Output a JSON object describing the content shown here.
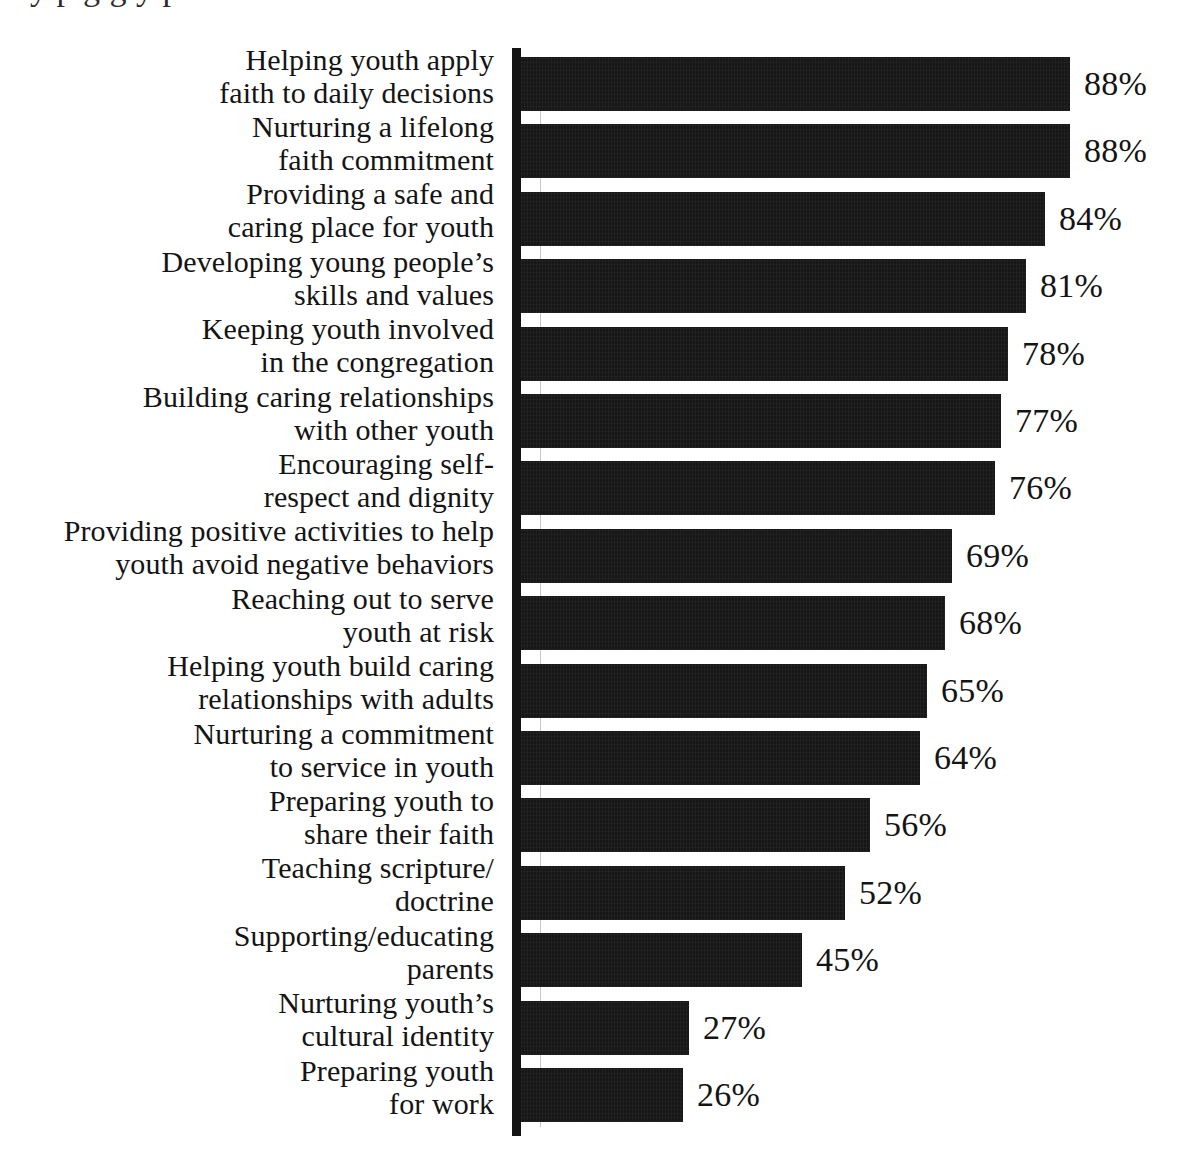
{
  "figure": {
    "top_cut_text": "y p              g g         y  p",
    "note": "scanned horizontal bar chart, no visible title or axis tick labels"
  },
  "chart_data": {
    "type": "bar",
    "orientation": "horizontal",
    "title": "",
    "subtitle": "",
    "xlabel": "",
    "ylabel": "",
    "xlim": [
      0,
      100
    ],
    "grid": true,
    "legend": false,
    "value_suffix": "%",
    "categories": [
      "Helping youth apply faith to daily decisions",
      "Nurturing a lifelong faith commitment",
      "Providing a safe and caring place for youth",
      "Developing young people’s skills and values",
      "Keeping youth involved in the congregation",
      "Building caring relationships with other youth",
      "Encouraging self-respect and dignity",
      "Providing positive activities to help youth avoid negative behaviors",
      "Reaching out to serve youth at risk",
      "Helping youth build caring relationships with adults",
      "Nurturing a commitment to service in youth",
      "Preparing youth to share their faith",
      "Teaching scripture/doctrine",
      "Supporting/educating parents",
      "Nurturing youth’s cultural identity",
      "Preparing youth for work"
    ],
    "values": [
      88,
      88,
      84,
      81,
      78,
      77,
      76,
      69,
      68,
      65,
      64,
      56,
      52,
      45,
      27,
      26
    ],
    "value_labels": [
      "88%",
      "88%",
      "84%",
      "81%",
      "78%",
      "77%",
      "76%",
      "69%",
      "68%",
      "65%",
      "64%",
      "56%",
      "52%",
      "45%",
      "27%",
      "26%"
    ],
    "rows": [
      {
        "lines": [
          "Helping youth apply",
          "faith to daily decisions"
        ],
        "value": 88,
        "label": "88%"
      },
      {
        "lines": [
          "Nurturing a lifelong",
          "faith commitment"
        ],
        "value": 88,
        "label": "88%"
      },
      {
        "lines": [
          "Providing a safe and",
          "caring place for youth"
        ],
        "value": 84,
        "label": "84%"
      },
      {
        "lines": [
          "Developing young people’s",
          "skills and values"
        ],
        "value": 81,
        "label": "81%"
      },
      {
        "lines": [
          "Keeping youth involved",
          "in the congregation"
        ],
        "value": 78,
        "label": "78%"
      },
      {
        "lines": [
          "Building caring relationships",
          "with other youth"
        ],
        "value": 77,
        "label": "77%"
      },
      {
        "lines": [
          "Encouraging self-",
          "respect and dignity"
        ],
        "value": 76,
        "label": "76%"
      },
      {
        "lines": [
          "Providing positive activities to help",
          "youth avoid negative behaviors"
        ],
        "value": 69,
        "label": "69%"
      },
      {
        "lines": [
          "Reaching out to serve",
          "youth at risk"
        ],
        "value": 68,
        "label": "68%"
      },
      {
        "lines": [
          "Helping youth build caring",
          "relationships with adults"
        ],
        "value": 65,
        "label": "65%"
      },
      {
        "lines": [
          "Nurturing a commitment",
          "to service in youth"
        ],
        "value": 64,
        "label": "64%"
      },
      {
        "lines": [
          "Preparing youth to",
          "share their faith"
        ],
        "value": 56,
        "label": "56%"
      },
      {
        "lines": [
          "Teaching scripture/",
          "doctrine"
        ],
        "value": 52,
        "label": "52%"
      },
      {
        "lines": [
          "Supporting/educating",
          "parents"
        ],
        "value": 45,
        "label": "45%"
      },
      {
        "lines": [
          "Nurturing youth’s",
          "cultural identity"
        ],
        "value": 27,
        "label": "27%"
      },
      {
        "lines": [
          "Preparing youth",
          "for work"
        ],
        "value": 26,
        "label": "26%"
      }
    ],
    "colors": {
      "bar": "#171717",
      "axis": "#141414",
      "gridline": "#9a9a9a",
      "text": "#141414",
      "background": "#ffffff"
    }
  }
}
